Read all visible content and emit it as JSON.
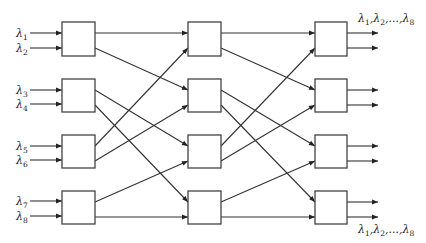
{
  "diagram": {
    "type": "3-stage switching network (Benes-like), 4 switches per stage",
    "inputs": [
      {
        "label": "λ",
        "sub": "1",
        "y": 33
      },
      {
        "label": "λ",
        "sub": "2",
        "y": 48
      },
      {
        "label": "λ",
        "sub": "3",
        "y": 90
      },
      {
        "label": "λ",
        "sub": "4",
        "y": 104
      },
      {
        "label": "λ",
        "sub": "5",
        "y": 146
      },
      {
        "label": "λ",
        "sub": "6",
        "y": 160
      },
      {
        "label": "λ",
        "sub": "7",
        "y": 201
      },
      {
        "label": "λ",
        "sub": "8",
        "y": 216
      }
    ],
    "stages": [
      {
        "name": "stage-1",
        "x": 62,
        "width": 33
      },
      {
        "name": "stage-2",
        "x": 188,
        "width": 33
      },
      {
        "name": "stage-3",
        "x": 315,
        "width": 32
      }
    ],
    "rows": [
      {
        "y": 22,
        "height": 34
      },
      {
        "y": 79,
        "height": 33
      },
      {
        "y": 135,
        "height": 33
      },
      {
        "y": 191,
        "height": 33
      }
    ],
    "port_offsets": {
      "top": 11,
      "bottom": 26
    },
    "interstage_connections": [
      {
        "from_row": 0,
        "from_port": "top",
        "to_row": 0,
        "to_port": "top"
      },
      {
        "from_row": 0,
        "from_port": "bottom",
        "to_row": 1,
        "to_port": "top"
      },
      {
        "from_row": 1,
        "from_port": "top",
        "to_row": 2,
        "to_port": "top"
      },
      {
        "from_row": 1,
        "from_port": "bottom",
        "to_row": 3,
        "to_port": "top"
      },
      {
        "from_row": 2,
        "from_port": "top",
        "to_row": 0,
        "to_port": "bottom"
      },
      {
        "from_row": 2,
        "from_port": "bottom",
        "to_row": 1,
        "to_port": "bottom"
      },
      {
        "from_row": 3,
        "from_port": "top",
        "to_row": 2,
        "to_port": "bottom"
      },
      {
        "from_row": 3,
        "from_port": "bottom",
        "to_row": 3,
        "to_port": "bottom"
      }
    ],
    "output_labels": {
      "top": {
        "parts": [
          [
            "λ",
            "1"
          ],
          [
            ",λ",
            "2"
          ],
          [
            ",...,λ",
            "8"
          ]
        ],
        "x": 358,
        "y": 22
      },
      "bottom": {
        "parts": [
          [
            "λ",
            "1"
          ],
          [
            ",λ",
            "2"
          ],
          [
            ",...,λ",
            "8"
          ]
        ],
        "x": 358,
        "y": 233
      }
    },
    "input_arrow": {
      "x1": 30,
      "x2": 62
    },
    "output_arrow": {
      "x1": 347,
      "x2": 378
    }
  }
}
